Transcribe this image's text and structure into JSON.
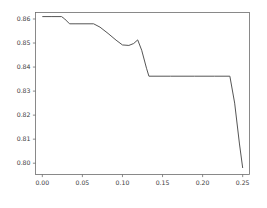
{
  "chart_data": {
    "type": "line",
    "title": "",
    "xlabel": "",
    "ylabel": "",
    "xlim": [
      -0.0085,
      0.2585
    ],
    "ylim": [
      0.7953,
      0.8627
    ],
    "xticks": [
      0.0,
      0.05,
      0.1,
      0.15,
      0.2,
      0.25
    ],
    "xtick_labels": [
      "0.00",
      "0.05",
      "0.10",
      "0.15",
      "0.20",
      "0.25"
    ],
    "yticks": [
      0.8,
      0.81,
      0.82,
      0.83,
      0.84,
      0.85,
      0.86
    ],
    "ytick_labels": [
      "0.80",
      "0.81",
      "0.82",
      "0.83",
      "0.84",
      "0.85",
      "0.86"
    ],
    "grid": false,
    "legend": null,
    "line_color": "#555555",
    "series": [
      {
        "name": "score",
        "x": [
          0.0,
          0.012,
          0.024,
          0.028,
          0.034,
          0.042,
          0.052,
          0.064,
          0.072,
          0.082,
          0.092,
          0.1,
          0.108,
          0.114,
          0.119,
          0.124,
          0.13,
          0.133,
          0.16,
          0.19,
          0.215,
          0.234,
          0.24,
          0.246,
          0.25
        ],
        "y": [
          0.861,
          0.861,
          0.861,
          0.86,
          0.858,
          0.858,
          0.858,
          0.858,
          0.8566,
          0.854,
          0.8512,
          0.8492,
          0.849,
          0.8498,
          0.8513,
          0.847,
          0.8395,
          0.8362,
          0.8362,
          0.8362,
          0.8362,
          0.8362,
          0.825,
          0.808,
          0.798
        ]
      }
    ]
  },
  "axes": {
    "tick_color": "#6d6d6d",
    "spine_color": "#6d6d6d",
    "label_color": "#3b3b3b"
  }
}
